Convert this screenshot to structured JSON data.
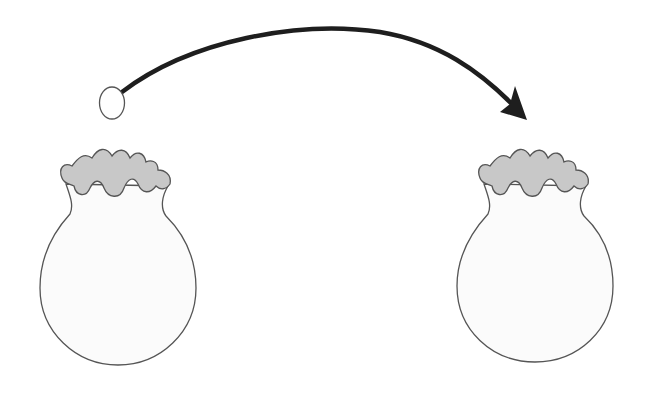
{
  "diagram": {
    "elements": [
      {
        "id": "ball",
        "shape": "ellipse",
        "label": ""
      },
      {
        "id": "transfer-arrow",
        "shape": "curved-arrow",
        "direction": "left-to-right",
        "label": ""
      },
      {
        "id": "left-flask",
        "shape": "round-bottom-flask-with-ruffled-top",
        "label": ""
      },
      {
        "id": "right-flask",
        "shape": "round-bottom-flask-with-ruffled-top",
        "label": ""
      }
    ],
    "colors": {
      "background": "#ffffff",
      "outline": "#4a4a4a",
      "arrow": "#1e1e1e",
      "ruffle_fill": "#c8c8c8",
      "flask_fill": "#fbfbfb",
      "ball_fill": "#ffffff"
    }
  }
}
